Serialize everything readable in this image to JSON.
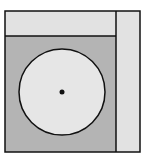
{
  "diagram": {
    "colors": {
      "background": "#ffffff",
      "strip_fill": "#e2e2e2",
      "main_fill": "#b4b4b4",
      "circle_fill": "#e6e6e6",
      "stroke": "#111111"
    },
    "regions": {
      "outer_frame": {
        "x": 5,
        "y": 11,
        "width": 135,
        "height": 141
      },
      "top_strip": {
        "x": 5,
        "y": 11,
        "width": 111,
        "height": 25
      },
      "right_strip": {
        "x": 116,
        "y": 11,
        "width": 24,
        "height": 141
      },
      "main_region": {
        "x": 5,
        "y": 36,
        "width": 111,
        "height": 116
      }
    },
    "circle": {
      "cx": 62,
      "cy": 92,
      "r": 43
    },
    "center_dot": {
      "cx": 62,
      "cy": 92,
      "r": 2.5
    }
  }
}
